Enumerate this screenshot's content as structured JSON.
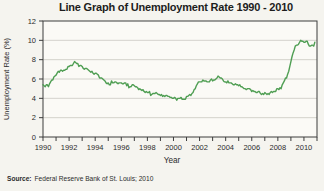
{
  "page": {
    "background": "#f5f4ef"
  },
  "source": {
    "label": "Source:",
    "text": "Federal Reserve Bank of St. Louis; 2010"
  },
  "chart_data": {
    "type": "line",
    "title": "Line Graph of Unemployment Rate 1990 - 2010",
    "xlabel": "Year",
    "ylabel": "Unemployment Rate (%)",
    "xlim": [
      1990,
      2011
    ],
    "ylim": [
      0,
      12
    ],
    "y_ticks": [
      0,
      2,
      4,
      6,
      8,
      10,
      12
    ],
    "x_tick_labels": [
      1990,
      1992,
      1994,
      1996,
      1998,
      2000,
      2002,
      2004,
      2006,
      2008,
      2010
    ],
    "x_minor_tick_interval_years": 1,
    "grid": "horizontal",
    "legend": "none",
    "colors": {
      "line": "#4f9e53",
      "grid": "#c9c8c1",
      "axis": "#3c3c3c",
      "plot_fill": "#fbfaf6",
      "tick_text": "#2b2b2b"
    },
    "series": [
      {
        "name": "U.S. unemployment rate (%), monthly",
        "x_start": 1990.0,
        "x_step_years": 0.0833333,
        "values": [
          5.4,
          5.3,
          5.2,
          5.4,
          5.4,
          5.2,
          5.5,
          5.7,
          5.9,
          5.9,
          6.2,
          6.3,
          6.4,
          6.6,
          6.8,
          6.7,
          6.9,
          6.9,
          6.8,
          6.9,
          6.9,
          7.0,
          7.0,
          7.3,
          7.3,
          7.4,
          7.4,
          7.4,
          7.6,
          7.8,
          7.7,
          7.6,
          7.6,
          7.3,
          7.4,
          7.4,
          7.3,
          7.1,
          7.0,
          7.1,
          7.1,
          7.0,
          6.9,
          6.8,
          6.7,
          6.8,
          6.6,
          6.5,
          6.6,
          6.6,
          6.5,
          6.4,
          6.1,
          6.1,
          6.1,
          6.0,
          5.9,
          5.8,
          5.6,
          5.5,
          5.6,
          5.4,
          5.4,
          5.8,
          5.6,
          5.6,
          5.7,
          5.7,
          5.6,
          5.5,
          5.6,
          5.6,
          5.6,
          5.5,
          5.5,
          5.6,
          5.6,
          5.3,
          5.5,
          5.1,
          5.2,
          5.2,
          5.4,
          5.4,
          5.3,
          5.2,
          5.2,
          5.1,
          4.9,
          5.0,
          4.9,
          4.8,
          4.9,
          4.7,
          4.6,
          4.7,
          4.6,
          4.6,
          4.7,
          4.3,
          4.4,
          4.5,
          4.5,
          4.5,
          4.6,
          4.5,
          4.4,
          4.4,
          4.3,
          4.4,
          4.2,
          4.3,
          4.2,
          4.3,
          4.3,
          4.2,
          4.2,
          4.1,
          4.1,
          4.0,
          4.0,
          4.1,
          4.0,
          3.8,
          4.0,
          4.0,
          4.0,
          4.1,
          3.9,
          3.9,
          3.9,
          3.9,
          4.2,
          4.2,
          4.3,
          4.4,
          4.3,
          4.5,
          4.6,
          4.9,
          5.0,
          5.3,
          5.5,
          5.7,
          5.7,
          5.7,
          5.7,
          5.9,
          5.8,
          5.8,
          5.8,
          5.7,
          5.7,
          5.7,
          5.9,
          6.0,
          5.8,
          5.9,
          5.9,
          6.0,
          6.1,
          6.3,
          6.2,
          6.1,
          6.1,
          6.0,
          5.8,
          5.7,
          5.7,
          5.6,
          5.8,
          5.6,
          5.6,
          5.6,
          5.5,
          5.4,
          5.4,
          5.5,
          5.4,
          5.4,
          5.3,
          5.4,
          5.2,
          5.2,
          5.1,
          5.0,
          5.0,
          4.9,
          5.0,
          5.0,
          5.0,
          4.9,
          4.7,
          4.8,
          4.7,
          4.7,
          4.6,
          4.6,
          4.7,
          4.7,
          4.5,
          4.4,
          4.5,
          4.4,
          4.6,
          4.5,
          4.4,
          4.5,
          4.4,
          4.6,
          4.7,
          4.6,
          4.7,
          4.7,
          4.7,
          5.0,
          5.0,
          4.9,
          5.1,
          5.0,
          5.4,
          5.6,
          5.8,
          6.1,
          6.1,
          6.5,
          6.8,
          7.3,
          7.8,
          8.3,
          8.7,
          9.0,
          9.4,
          9.5,
          9.5,
          9.6,
          9.8,
          10.0,
          9.9,
          9.9,
          9.8,
          9.8,
          9.9,
          9.9,
          9.6,
          9.4,
          9.4,
          9.5,
          9.5,
          9.4,
          9.8
        ]
      }
    ]
  }
}
